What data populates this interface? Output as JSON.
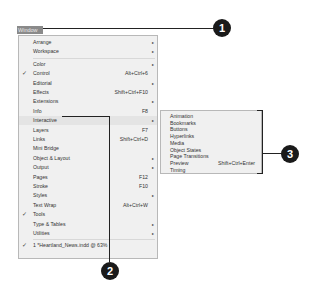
{
  "menu_title": "Window",
  "menu": {
    "items": [
      {
        "label": "Arrange",
        "shortcut": "",
        "submenu": true,
        "checked": false
      },
      {
        "label": "Workspace",
        "shortcut": "",
        "submenu": true,
        "checked": false
      },
      {
        "label": "Color",
        "shortcut": "",
        "submenu": true,
        "checked": false
      },
      {
        "label": "Control",
        "shortcut": "Alt+Ctrl+6",
        "submenu": false,
        "checked": true
      },
      {
        "label": "Editorial",
        "shortcut": "",
        "submenu": true,
        "checked": false
      },
      {
        "label": "Effects",
        "shortcut": "Shift+Ctrl+F10",
        "submenu": false,
        "checked": false
      },
      {
        "label": "Extensions",
        "shortcut": "",
        "submenu": true,
        "checked": false
      },
      {
        "label": "Info",
        "shortcut": "F8",
        "submenu": false,
        "checked": false
      },
      {
        "label": "Interactive",
        "shortcut": "",
        "submenu": true,
        "checked": false
      },
      {
        "label": "Layers",
        "shortcut": "F7",
        "submenu": false,
        "checked": false
      },
      {
        "label": "Links",
        "shortcut": "Shift+Ctrl+D",
        "submenu": false,
        "checked": false
      },
      {
        "label": "Mini Bridge",
        "shortcut": "",
        "submenu": false,
        "checked": false
      },
      {
        "label": "Object & Layout",
        "shortcut": "",
        "submenu": true,
        "checked": false
      },
      {
        "label": "Output",
        "shortcut": "",
        "submenu": true,
        "checked": false
      },
      {
        "label": "Pages",
        "shortcut": "F12",
        "submenu": false,
        "checked": false
      },
      {
        "label": "Stroke",
        "shortcut": "F10",
        "submenu": false,
        "checked": false
      },
      {
        "label": "Styles",
        "shortcut": "",
        "submenu": true,
        "checked": false
      },
      {
        "label": "Text Wrap",
        "shortcut": "Alt+Ctrl+W",
        "submenu": false,
        "checked": false
      },
      {
        "label": "Tools",
        "shortcut": "",
        "submenu": false,
        "checked": true
      },
      {
        "label": "Type & Tables",
        "shortcut": "",
        "submenu": true,
        "checked": false
      },
      {
        "label": "Utilities",
        "shortcut": "",
        "submenu": true,
        "checked": false
      },
      {
        "label": "1 *Heartland_News.indd @ 63%",
        "shortcut": "",
        "submenu": false,
        "checked": true
      }
    ],
    "check_glyph": "✓",
    "arrow_glyph": "▸"
  },
  "submenu": {
    "items": [
      {
        "label": "Animation",
        "shortcut": ""
      },
      {
        "label": "Bookmarks",
        "shortcut": ""
      },
      {
        "label": "Buttons",
        "shortcut": ""
      },
      {
        "label": "Hyperlinks",
        "shortcut": ""
      },
      {
        "label": "Media",
        "shortcut": ""
      },
      {
        "label": "Object States",
        "shortcut": ""
      },
      {
        "label": "Page Transitions",
        "shortcut": ""
      },
      {
        "label": "Preview",
        "shortcut": "Shift+Ctrl+Enter"
      },
      {
        "label": "Timing",
        "shortcut": ""
      }
    ]
  },
  "callouts": [
    {
      "number": "1"
    },
    {
      "number": "2"
    },
    {
      "number": "3"
    }
  ]
}
